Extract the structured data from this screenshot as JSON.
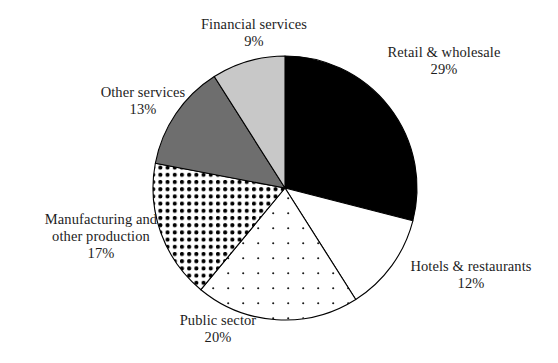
{
  "chart_data": {
    "type": "pie",
    "title": "",
    "subtitle": "",
    "xlabel": "",
    "ylabel": "",
    "legend_position": "none",
    "grid": false,
    "start_angle_deg": 0,
    "direction": "clockwise",
    "center": {
      "cx": 285,
      "cy": 188,
      "r": 132
    },
    "categories": [
      "Retail & wholesale",
      "Hotels & restaurants",
      "Public sector",
      "Manufacturing and other production",
      "Other services",
      "Financial services"
    ],
    "values": [
      29,
      12,
      20,
      17,
      13,
      9
    ],
    "value_labels": [
      "29%",
      "12%",
      "20%",
      "17%",
      "13%",
      "9%"
    ],
    "units": "percent",
    "total": 100,
    "slices": [
      {
        "name": "Retail & wholesale",
        "label_lines": [
          "Retail & wholesale"
        ],
        "value": 29,
        "value_label": "29%",
        "fill_style": "solid",
        "color": "#000000",
        "start_deg": 0,
        "end_deg": 104.4
      },
      {
        "name": "Hotels & restaurants",
        "label_lines": [
          "Hotels & restaurants"
        ],
        "value": 12,
        "value_label": "12%",
        "fill_style": "solid",
        "color": "#ffffff",
        "start_deg": 104.4,
        "end_deg": 147.6
      },
      {
        "name": "Public sector",
        "label_lines": [
          "Public sector"
        ],
        "value": 20,
        "value_label": "20%",
        "fill_style": "fine-dots",
        "color": "#ffffff",
        "start_deg": 147.6,
        "end_deg": 219.6
      },
      {
        "name": "Manufacturing and other production",
        "label_lines": [
          "Manufacturing and",
          "other production"
        ],
        "value": 17,
        "value_label": "17%",
        "fill_style": "bold-dots",
        "color": "#ffffff",
        "start_deg": 219.6,
        "end_deg": 280.8
      },
      {
        "name": "Other services",
        "label_lines": [
          "Other services"
        ],
        "value": 13,
        "value_label": "13%",
        "fill_style": "solid",
        "color": "#6e6e6e",
        "start_deg": 280.8,
        "end_deg": 327.6
      },
      {
        "name": "Financial services",
        "label_lines": [
          "Financial services"
        ],
        "value": 9,
        "value_label": "9%",
        "fill_style": "solid",
        "color": "#c8c8c8",
        "start_deg": 327.6,
        "end_deg": 360
      }
    ],
    "stroke_color": "#000000",
    "background": "#ffffff"
  },
  "labels": {
    "financial": {
      "line1": "Financial services",
      "pct": "9%"
    },
    "retail": {
      "line1": "Retail & wholesale",
      "pct": "29%"
    },
    "other_services": {
      "line1": "Other services",
      "pct": "13%"
    },
    "manufacturing": {
      "line1": "Manufacturing and",
      "line2": "other production",
      "pct": "17%"
    },
    "public_sector": {
      "line1": "Public sector",
      "pct": "20%"
    },
    "hotels": {
      "line1": "Hotels & restaurants",
      "pct": "12%"
    }
  }
}
